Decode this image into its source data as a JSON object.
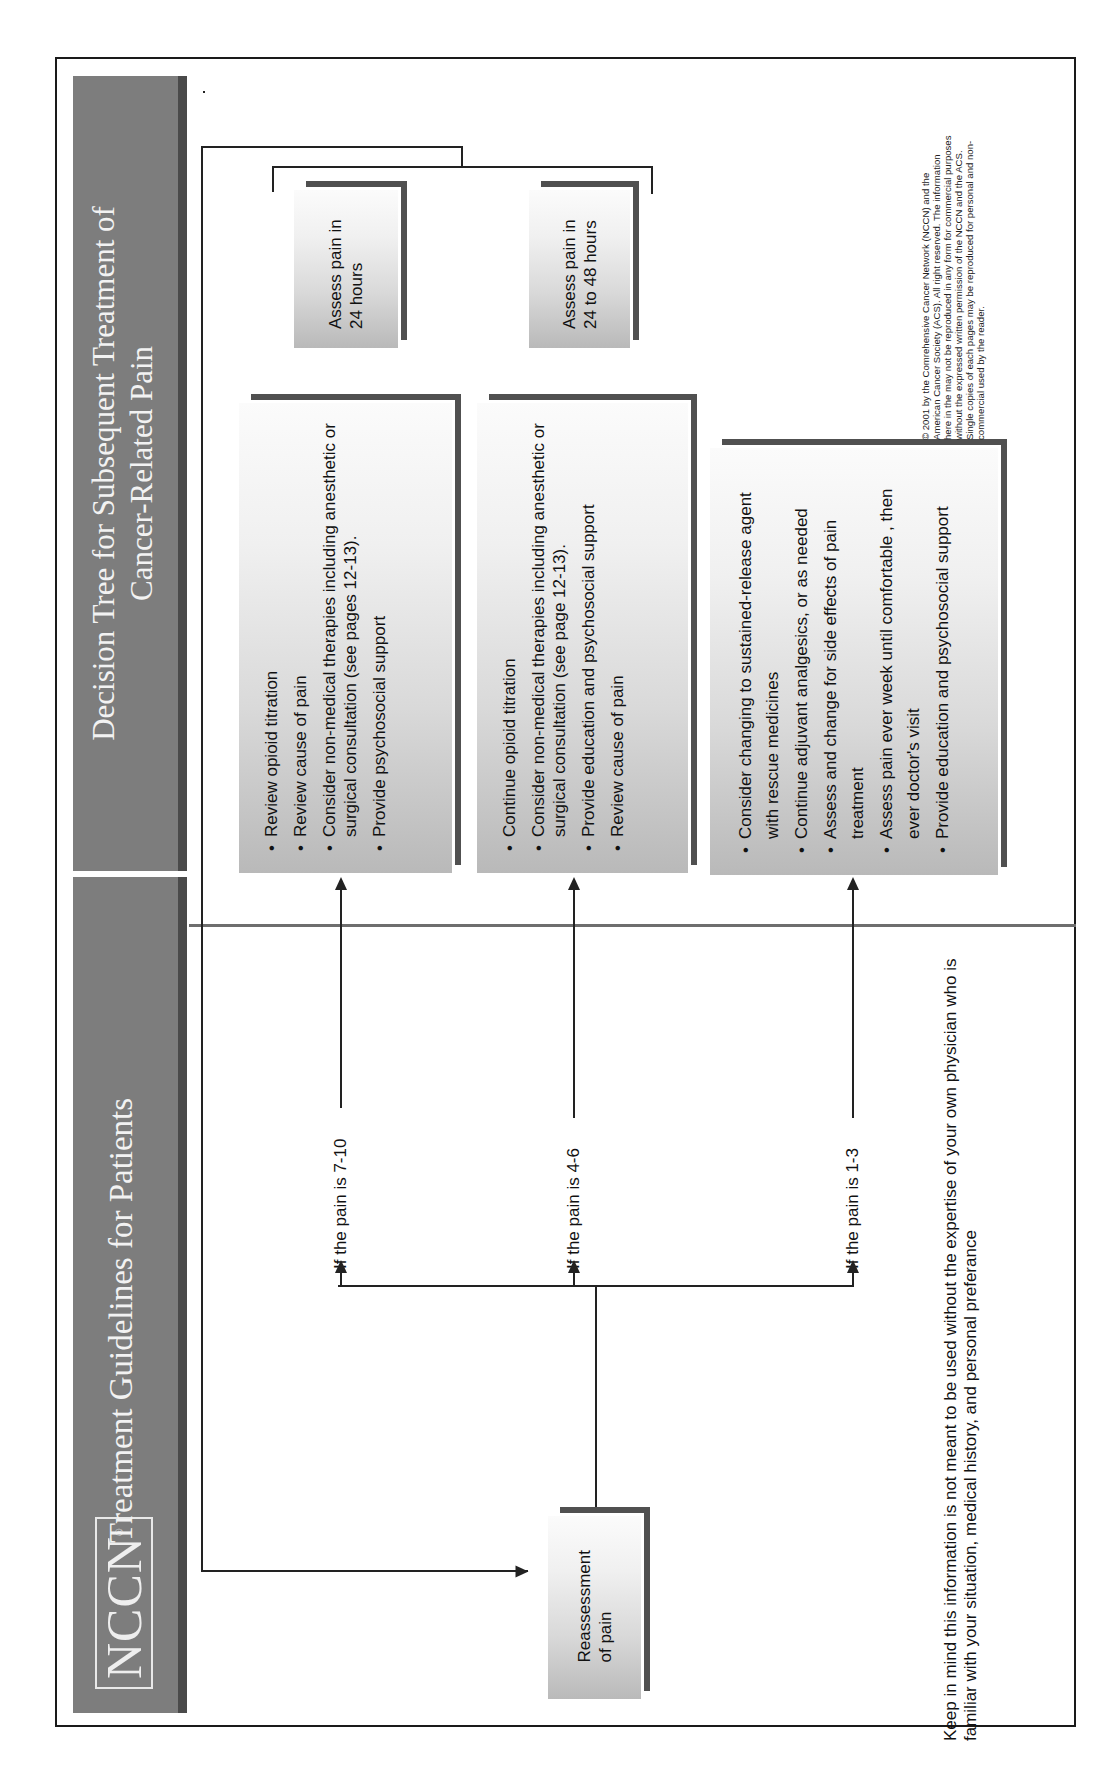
{
  "header": {
    "logo": "NCCN",
    "logo_mark": "®",
    "left_title": "Treatment Guidelines for Patients",
    "right_title_line1": "Decision Tree for Subsequent Treatment of",
    "right_title_line2": "Cancer-Related Pain"
  },
  "start_node": {
    "label_line1": "Reassessment",
    "label_line2": "of pain"
  },
  "branches": [
    {
      "condition": "If the pain is 7-10",
      "actions": [
        "Review opioid titration",
        "Review cause of pain",
        "Consider non-medical therapies including anesthetic or surgical consultation (see pages 12-13).",
        "Provide psychosocial support"
      ],
      "followup_line1": "Assess pain in",
      "followup_line2": "24 hours"
    },
    {
      "condition": "If the pain is 4-6",
      "actions": [
        "Continue opioid titration",
        "Consider non-medical therapies including anesthetic or surgical consultation (see page 12-13).",
        "Provide education and psychosocial support",
        "Review cause of pain"
      ],
      "followup_line1": "Assess pain in",
      "followup_line2": "24 to 48 hours"
    },
    {
      "condition": "If the pain is 1-3",
      "actions": [
        "Consider changing to sustained-release agent with rescue medicines",
        "Continue adjuvant analgesics, or as needed",
        "Assess and change for side effects of pain treatment",
        "Assess pain ever week until comfortable , then ever doctor's visit",
        "Provide education and psychosocial support"
      ]
    }
  ],
  "note": "Keep in mind this information is not meant to be used without the expertise of your own physician who is familiar with your situation, medical history, and personal preferance",
  "copyright": "© 2001 by the Comrehensive Cancer Network (NCCN) and the American Cancer Society (ACS). All right reserved. The information here in the may not be reproduced in any form for commercial purposes without the expressed written permission of the NCCN and the ACS. Single copies of each pages may be reproduced for personal and non-commercial used by the reader.",
  "colors": {
    "header_band": "#7d7d7d",
    "header_shadow": "#4a4a4a",
    "box_edge": "#505050",
    "line": "#222222"
  }
}
